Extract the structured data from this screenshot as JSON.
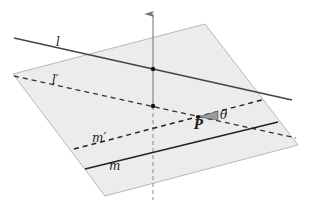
{
  "diagram": {
    "type": "geometry-3d-projection",
    "colors": {
      "plane_fill": "#ececec",
      "plane_edge": "#b8b8b8",
      "line": "#444444",
      "dashed": "#333333",
      "axis": "#888888",
      "point": "#111111",
      "angle_fill": "#9a9a9a"
    },
    "labels": {
      "l": "l",
      "l_prime": "l′",
      "m": "m",
      "m_prime": "m′",
      "P": "P",
      "theta": "θ"
    },
    "elements": [
      {
        "name": "plane",
        "kind": "parallelogram"
      },
      {
        "name": "vertical-axis",
        "kind": "arrow",
        "note": "solid above plane, dashed below"
      },
      {
        "name": "line-l",
        "kind": "solid line",
        "label": "l"
      },
      {
        "name": "line-l-prime",
        "kind": "dashed line (projection of l)",
        "label": "l′"
      },
      {
        "name": "line-m",
        "kind": "solid line",
        "label": "m"
      },
      {
        "name": "line-m-prime",
        "kind": "dashed line through P",
        "label": "m′"
      },
      {
        "name": "point-P",
        "kind": "point",
        "label": "P"
      },
      {
        "name": "angle-theta",
        "kind": "angle marker",
        "label": "θ"
      }
    ]
  }
}
